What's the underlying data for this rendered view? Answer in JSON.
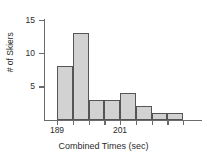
{
  "chart_data": {
    "type": "bar",
    "title": "",
    "subtitle": "",
    "xlabel": "Combined Times (sec)",
    "ylabel": "# of Skiers",
    "grid": false,
    "legend": null,
    "bin_width": 3,
    "bin_starts": [
      189,
      192,
      195,
      198,
      201,
      204,
      207,
      210
    ],
    "categories": [
      "189-192",
      "192-195",
      "195-198",
      "198-201",
      "201-204",
      "204-207",
      "207-210",
      "210-213"
    ],
    "values": [
      8,
      13,
      3,
      3,
      4,
      2,
      1,
      1
    ],
    "ylim": [
      0,
      15
    ],
    "xlim": [
      189,
      213
    ],
    "yticks": [
      5,
      10,
      15
    ],
    "ytick_labels": [
      "5",
      "10",
      "15"
    ],
    "xticks": [
      189,
      192,
      195,
      198,
      201,
      204,
      207,
      210,
      213
    ],
    "xtick_labels": [
      "189",
      "",
      "",
      "",
      "201",
      "",
      "",
      "",
      ""
    ],
    "labeled_xticks": [
      {
        "value": 189,
        "label": "189"
      },
      {
        "value": 201,
        "label": "201"
      }
    ],
    "bar_fill_color": "#d2d2d2",
    "bar_edge_color": "#555555",
    "axis_color": "#6b6b6b",
    "text_color": "#2b2b2b"
  }
}
